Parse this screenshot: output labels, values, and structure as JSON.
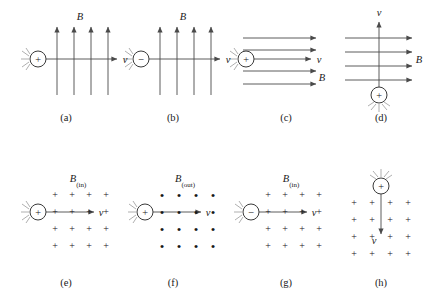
{
  "figure": {
    "stroke_color": "#4a4a4a",
    "text_color": "#1a1a1a",
    "background": "#ffffff",
    "symbols": {
      "B": "B",
      "v": "v",
      "plus": "+",
      "minus": "−",
      "dot": "•",
      "B_in": "B",
      "B_in_sub": "(in)",
      "B_out": "B",
      "B_out_sub": "(out)"
    }
  },
  "panels": [
    {
      "id": "a",
      "label": "(a)",
      "label_x": 66,
      "label_y": 119,
      "charge_sign": "+",
      "charge_x": 38,
      "charge_y": 59,
      "field_type": "vertical-arrows-up",
      "field_label": "B",
      "field_label_x": 80,
      "field_label_y": 16,
      "velocity_label": "v",
      "velocity_label_x": 125,
      "velocity_label_y": 59,
      "velocity_direction": "right",
      "field_arrow_count": 4
    },
    {
      "id": "b",
      "label": "(b)",
      "label_x": 173,
      "label_y": 119,
      "charge_sign": "−",
      "charge_x": 141,
      "charge_y": 59,
      "field_type": "vertical-arrows-up",
      "field_label": "B",
      "field_label_x": 183,
      "field_label_y": 16,
      "velocity_label": "v",
      "velocity_label_x": 228,
      "velocity_label_y": 59,
      "velocity_direction": "right",
      "field_arrow_count": 4
    },
    {
      "id": "c",
      "label": "(c)",
      "label_x": 286,
      "label_y": 119,
      "charge_sign": "+",
      "charge_x": 246,
      "charge_y": 59,
      "field_type": "horizontal-arrows-right",
      "field_label": "B",
      "field_label_x": 322,
      "field_label_y": 77,
      "velocity_label": "v",
      "velocity_label_x": 319,
      "velocity_label_y": 59,
      "velocity_direction": "right",
      "field_arrow_count": 4
    },
    {
      "id": "d",
      "label": "(d)",
      "label_x": 381,
      "label_y": 119,
      "charge_sign": "+",
      "charge_x": 379,
      "charge_y": 95,
      "field_type": "horizontal-arrows-right",
      "field_label": "B",
      "field_label_x": 416,
      "field_label_y": 59,
      "velocity_label": "v",
      "velocity_label_x": 379,
      "velocity_label_y": 12,
      "velocity_direction": "up",
      "field_arrow_count": 4
    },
    {
      "id": "e",
      "label": "(e)",
      "label_x": 66,
      "label_y": 284,
      "charge_sign": "+",
      "charge_x": 38,
      "charge_y": 212,
      "field_type": "grid-plus",
      "field_label": "B",
      "field_label_sub": "(in)",
      "field_label_x": 78,
      "field_label_y": 180,
      "velocity_label": "v",
      "velocity_label_x": 101,
      "velocity_label_y": 212,
      "velocity_direction": "right",
      "grid_rows": 4,
      "grid_cols": 4
    },
    {
      "id": "f",
      "label": "(f)",
      "label_x": 173,
      "label_y": 284,
      "charge_sign": "+",
      "charge_x": 145,
      "charge_y": 212,
      "field_type": "grid-dot",
      "field_label": "B",
      "field_label_sub": "(out)",
      "field_label_x": 185,
      "field_label_y": 180,
      "velocity_label": "v",
      "velocity_label_x": 208,
      "velocity_label_y": 212,
      "velocity_direction": "right",
      "grid_rows": 4,
      "grid_cols": 4
    },
    {
      "id": "g",
      "label": "(g)",
      "label_x": 286,
      "label_y": 284,
      "charge_sign": "−",
      "charge_x": 251,
      "charge_y": 212,
      "field_type": "grid-plus",
      "field_label": "B",
      "field_label_sub": "(in)",
      "field_label_x": 291,
      "field_label_y": 180,
      "velocity_label": "v",
      "velocity_label_x": 314,
      "velocity_label_y": 212,
      "velocity_direction": "right",
      "grid_rows": 4,
      "grid_cols": 4
    },
    {
      "id": "h",
      "label": "(h)",
      "label_x": 381,
      "label_y": 284,
      "charge_sign": "+",
      "charge_x": 381,
      "charge_y": 186,
      "field_type": "grid-plus",
      "field_label": "",
      "field_label_sub": "",
      "velocity_label": "v",
      "velocity_label_x": 381,
      "velocity_label_y": 240,
      "velocity_direction": "down",
      "grid_rows": 4,
      "grid_cols": 4
    }
  ]
}
